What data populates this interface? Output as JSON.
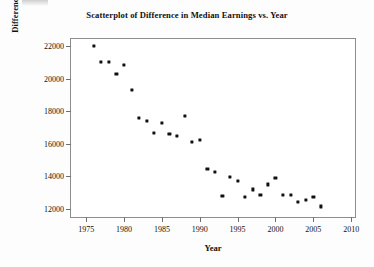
{
  "chart_data": {
    "type": "scatter",
    "title": "Scatterplot of Difference in Median Earnings vs. Year",
    "xlabel": "Year",
    "ylabel": "Difference in Median Earnings",
    "xlim": [
      1973,
      2010.5
    ],
    "ylim": [
      11500,
      22450
    ],
    "grid": false,
    "legend": null,
    "xticks": [
      1975,
      1980,
      1985,
      1990,
      1995,
      2000,
      2005,
      2010
    ],
    "xtick_labels": [
      "1975",
      "1980",
      "1985",
      "1990",
      "1995",
      "2000",
      "2005",
      "2010"
    ],
    "yticks": [
      12000,
      14000,
      16000,
      18000,
      20000,
      22000
    ],
    "ytick_labels": [
      "12000",
      "14000",
      "16000",
      "18000",
      "20000",
      "22000"
    ],
    "marker": "filled-square",
    "marker_color": "#111111",
    "x": [
      1976,
      1977,
      1978,
      1979,
      1980,
      1981,
      1982,
      1983,
      1984,
      1985,
      1986,
      1987,
      1988,
      1989,
      1990,
      1991,
      1992,
      1993,
      1994,
      1995,
      1996,
      1997,
      1998,
      1999,
      2000,
      2001,
      2002,
      2003,
      2004,
      2005,
      2006
    ],
    "y": [
      22050,
      21050,
      21050,
      20300,
      20850,
      19300,
      17600,
      17400,
      16650,
      17300,
      16600,
      16500,
      17700,
      16100,
      16250,
      14450,
      14250,
      12800,
      13950,
      13700,
      12750,
      13200,
      12850,
      13500,
      13900,
      12850,
      12850,
      12450,
      12550,
      12750,
      12150
    ],
    "points": [
      {
        "x": 1976,
        "y": 22050
      },
      {
        "x": 1977,
        "y": 21050
      },
      {
        "x": 1978,
        "y": 21050
      },
      {
        "x": 1979,
        "y": 20300
      },
      {
        "x": 1980,
        "y": 20850
      },
      {
        "x": 1981,
        "y": 19300
      },
      {
        "x": 1982,
        "y": 17600
      },
      {
        "x": 1983,
        "y": 17400
      },
      {
        "x": 1984,
        "y": 16650
      },
      {
        "x": 1985,
        "y": 17300
      },
      {
        "x": 1986,
        "y": 16600
      },
      {
        "x": 1987,
        "y": 16500
      },
      {
        "x": 1988,
        "y": 17700
      },
      {
        "x": 1989,
        "y": 16100
      },
      {
        "x": 1990,
        "y": 16250
      },
      {
        "x": 1991,
        "y": 14450
      },
      {
        "x": 1992,
        "y": 14250
      },
      {
        "x": 1993,
        "y": 12800
      },
      {
        "x": 1994,
        "y": 13950
      },
      {
        "x": 1995,
        "y": 13700
      },
      {
        "x": 1996,
        "y": 12750
      },
      {
        "x": 1997,
        "y": 13200
      },
      {
        "x": 1998,
        "y": 12850
      },
      {
        "x": 1999,
        "y": 13500
      },
      {
        "x": 2000,
        "y": 13900
      },
      {
        "x": 2001,
        "y": 12850
      },
      {
        "x": 2002,
        "y": 12850
      },
      {
        "x": 2003,
        "y": 12450
      },
      {
        "x": 2004,
        "y": 12550
      },
      {
        "x": 2005,
        "y": 12750
      },
      {
        "x": 2006,
        "y": 12150
      }
    ]
  }
}
